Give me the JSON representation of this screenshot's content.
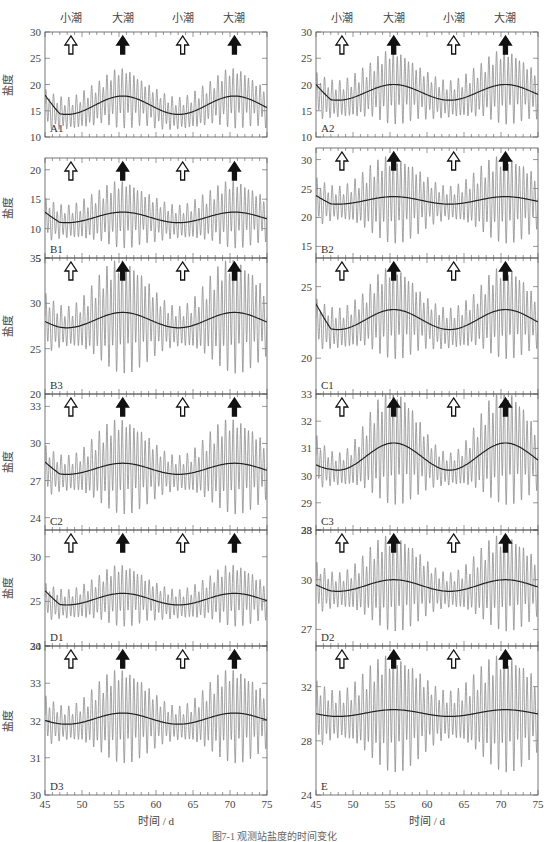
{
  "figure": {
    "x_axis_label": "时间 / d",
    "y_axis_label": "盐度",
    "neap_label": "小潮",
    "spring_label": "大潮",
    "caption": "图7-1 观测站盐度的时间变化",
    "line_gray": "#8c8c8c",
    "line_dark": "#222222"
  },
  "chart_data": {
    "type": "line",
    "title": "",
    "xlabel": "时间 / d",
    "ylabel": "盐度",
    "xlim": [
      45,
      75
    ],
    "x_ticks": [
      45,
      50,
      55,
      60,
      65,
      70,
      75
    ],
    "annotations": [
      {
        "label": "小潮",
        "x": 48.5,
        "arrow": "hollow"
      },
      {
        "label": "大潮",
        "x": 55.5,
        "arrow": "filled"
      },
      {
        "label": "小潮",
        "x": 63.6,
        "arrow": "hollow"
      },
      {
        "label": "大潮",
        "x": 70.6,
        "arrow": "filled"
      }
    ],
    "panels": [
      {
        "id": "A1",
        "col": 0,
        "row": 0,
        "ylim": [
          10,
          30
        ],
        "yticks": [
          10,
          15,
          20,
          25,
          30
        ],
        "mean_start": 18,
        "mean_low": 14.3,
        "mean_high": 17.8,
        "osc_max": 23,
        "osc_min": 10.5
      },
      {
        "id": "A2",
        "col": 1,
        "row": 0,
        "ylim": [
          10,
          30
        ],
        "yticks": [
          10,
          15,
          20,
          25,
          30
        ],
        "mean_start": 20,
        "mean_low": 17,
        "mean_high": 20,
        "osc_max": 27,
        "osc_min": 11
      },
      {
        "id": "B1",
        "col": 0,
        "row": 1,
        "ylim": [
          5,
          22
        ],
        "yticks": [
          5,
          10,
          15,
          20
        ],
        "mean_start": 12.8,
        "mean_low": 11,
        "mean_high": 12.8,
        "osc_max": 19,
        "osc_min": 5.5
      },
      {
        "id": "B2",
        "col": 1,
        "row": 1,
        "ylim": [
          13,
          32
        ],
        "yticks": [
          15,
          20,
          25,
          30
        ],
        "mean_start": 23.8,
        "mean_low": 22.3,
        "mean_high": 23.6,
        "osc_max": 27.5,
        "osc_min": 14
      },
      {
        "id": "B3",
        "col": 0,
        "row": 2,
        "ylim": [
          20,
          35
        ],
        "yticks": [
          20,
          25,
          30,
          35
        ],
        "mean_start": 28,
        "mean_low": 27.3,
        "mean_high": 29,
        "osc_max": 31,
        "osc_min": 21
      },
      {
        "id": "C1",
        "col": 1,
        "row": 2,
        "ylim": [
          17.5,
          27
        ],
        "yticks": [
          20,
          25
        ],
        "mean_start": 23.8,
        "mean_low": 22,
        "mean_high": 23.4,
        "osc_max": 26,
        "osc_min": 19.3
      },
      {
        "id": "C2",
        "col": 0,
        "row": 3,
        "ylim": [
          23,
          34
        ],
        "yticks": [
          24,
          27,
          30,
          33
        ],
        "mean_start": 28.5,
        "mean_low": 27.5,
        "mean_high": 28.4,
        "osc_max": 31.6,
        "osc_min": 23.5
      },
      {
        "id": "C3",
        "col": 1,
        "row": 3,
        "ylim": [
          28,
          33
        ],
        "yticks": [
          28,
          29,
          30,
          31,
          32,
          33
        ],
        "mean_start": 30.4,
        "mean_low": 30.2,
        "mean_high": 31.2,
        "osc_max": 31.7,
        "osc_min": 28.5
      },
      {
        "id": "D1",
        "col": 0,
        "row": 4,
        "ylim": [
          20,
          33
        ],
        "yticks": [
          20,
          25,
          30
        ],
        "mean_start": 26.2,
        "mean_low": 24.6,
        "mean_high": 25.9,
        "osc_max": 29.2,
        "osc_min": 21.5
      },
      {
        "id": "D2",
        "col": 1,
        "row": 4,
        "ylim": [
          26,
          33
        ],
        "yticks": [
          27,
          30,
          33
        ],
        "mean_start": 29.7,
        "mean_low": 29.3,
        "mean_high": 30,
        "osc_max": 31.8,
        "osc_min": 26.3
      },
      {
        "id": "D3",
        "col": 0,
        "row": 5,
        "ylim": [
          30,
          34
        ],
        "yticks": [
          30,
          31,
          32,
          33,
          34
        ],
        "mean_start": 32,
        "mean_low": 31.9,
        "mean_high": 32.2,
        "osc_max": 32.8,
        "osc_min": 30.6
      },
      {
        "id": "E",
        "col": 1,
        "row": 5,
        "ylim": [
          24,
          35
        ],
        "yticks": [
          24,
          28,
          32
        ],
        "mean_start": 30,
        "mean_low": 29.8,
        "mean_high": 30.3,
        "osc_max": 31.8,
        "osc_min": 24.8
      }
    ]
  }
}
